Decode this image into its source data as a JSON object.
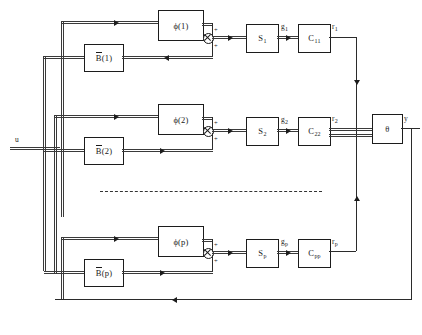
{
  "diagram": {
    "input_label": "u",
    "output_label": "y",
    "aggregator_label": "θ",
    "ellipsis": "dashed-continuation",
    "sum_sign_top": "+",
    "sum_sign_bottom": "+",
    "channels": [
      {
        "index": "1",
        "phi_label": "ϕ(1)",
        "b_label": "B",
        "b_arg": "(1)",
        "s_label": "S",
        "s_sub": "1",
        "g_label": "g",
        "g_sub": "1",
        "c_label": "C",
        "c_sub": "11",
        "r_label": "r",
        "r_sub": "1"
      },
      {
        "index": "2",
        "phi_label": "ϕ(2)",
        "b_label": "B",
        "b_arg": "(2)",
        "s_label": "S",
        "s_sub": "2",
        "g_label": "g",
        "g_sub": "2",
        "c_label": "C",
        "c_sub": "22",
        "r_label": "r",
        "r_sub": "2"
      },
      {
        "index": "p",
        "phi_label": "ϕ(p)",
        "b_label": "B",
        "b_arg": "(p)",
        "s_label": "S",
        "s_sub": "p",
        "g_label": "g",
        "g_sub": "p",
        "c_label": "C",
        "c_sub": "pp",
        "r_label": "r",
        "r_sub": "p"
      }
    ],
    "colors": {
      "line": "#2b2b2b",
      "block_border": "#1c1c1c",
      "text": "#1a1a1a",
      "background": "#ffffff"
    }
  }
}
